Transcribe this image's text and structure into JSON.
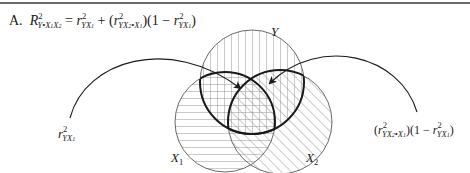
{
  "figure": {
    "panel_label": "A.",
    "formula": {
      "lhs": "R²Y•X₁X₂",
      "equals": "=",
      "term1": "r²YX₁",
      "plus": "+",
      "term2": "(r²YX₂•X₁)(1 − r²YX₁)"
    },
    "circles": [
      {
        "label": "Y",
        "cx": 252,
        "cy": 82,
        "r": 52,
        "hatch": "vertical"
      },
      {
        "label": "X1",
        "cx": 225,
        "cy": 122,
        "r": 50,
        "hatch": "horizontal"
      },
      {
        "label": "X2",
        "cx": 280,
        "cy": 122,
        "r": 52,
        "hatch": "diagonal"
      }
    ],
    "labels": {
      "y": "Y",
      "x1_main": "X",
      "x1_sub": "1",
      "x2_main": "X",
      "x2_sub": "2",
      "left_annotation": "r²YX₁",
      "right_annotation": "(r²YX₂•X₁)(1 − r²YX₁)"
    },
    "arrows": [
      {
        "from": "left_annotation",
        "to": "X1∩Y overlap"
      },
      {
        "from": "right_annotation",
        "to": "X2∩Y unique overlap"
      }
    ],
    "colors": {
      "line": "#6a6a6a",
      "bold": "#1a1a1a",
      "hatch": "#8a8a8a"
    }
  }
}
